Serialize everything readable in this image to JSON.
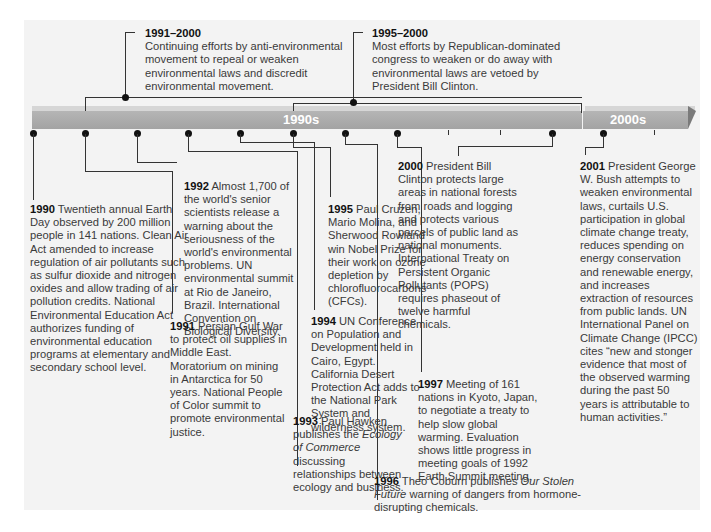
{
  "timeline": {
    "decades": [
      {
        "label": "1990s"
      },
      {
        "label": "2000s"
      }
    ],
    "colors": {
      "band": "#a9a9a9",
      "band_top": "#d6d6d6",
      "panel": "#f3f3f3",
      "connector": "#333333",
      "dot": "#111111"
    }
  },
  "spans": [
    {
      "year": "1991–2000",
      "text": "Continuing efforts by anti-environmental movement to repeal or weaken environmental laws and discredit environmental movement."
    },
    {
      "year": "1995–2000",
      "text": "Most efforts by Republican-dominated congress to weaken or do away with environmental laws are vetoed by President Bill Clinton."
    }
  ],
  "events": [
    {
      "year": "1990",
      "text": "Twentieth annual Earth Day observed by 200 million people in 141 nations. Clean Air Act amended to increase regulation of air pollutants such as sulfur dioxide and nitrogen oxides and allow trading of air pollution credits. National Environmental Education Act authorizes funding of environmental education programs at elementary and secondary school level."
    },
    {
      "year": "1991",
      "text": "Persian Gulf War to protect oil supplies in Middle East. Moratorium on mining in Antarctica for 50 years. National People of Color summit to promote environmental justice."
    },
    {
      "year": "1992",
      "text": "Almost 1,700 of the world's senior scientists release a warning about the seriousness of the world's environmental problems. UN environmental summit at Rio de Janeiro, Brazil. International Convention on Biological Diversity."
    },
    {
      "year": "1993",
      "text_before": "Paul Hawken publishes the ",
      "italic": "Ecology of Commerce",
      "text_after": " discussing relationships between ecology and business."
    },
    {
      "year": "1994",
      "text": "UN Conference on Population and Development held in Cairo, Egypt. California Desert Protection Act adds to the National Park System and wilderness system."
    },
    {
      "year": "1995",
      "text": "Paul Cruzen, Mario Molina, and Sherwood Rowland win Nobel Prize for their work on ozone depletion by chlorofluorocarbons (CFCs)."
    },
    {
      "year": "1996",
      "text_before": "Theo Coburn publishes ",
      "italic": "Our Stolen Future",
      "text_after": " warning of dangers from hormone-disrupting chemicals."
    },
    {
      "year": "1997",
      "text": "Meeting of 161 nations in Kyoto, Japan, to negotiate  a treaty to help slow global warming. Evaluation shows little progress in meeting goals of 1992 Earth Summit meeting."
    },
    {
      "year": "2000",
      "text": "President Bill Clinton protects large areas in national forests from roads and logging and protects various parcels of public land as national monuments. International Treaty on Persistent Organic Pollutants (POPS) requires phaseout of twelve harmful chemicals."
    },
    {
      "year": "2001",
      "text": " President George W. Bush attempts to weaken environmental laws, curtails U.S. participation in global climate change treaty, reduces spending on energy conservation and renewable energy, and increases extraction of resources from public lands. UN International Panel on Climate Change (IPCC) cites “new and stonger evidence that most of the observed warming during the past 50 years is attributable to human activities.”"
    }
  ]
}
